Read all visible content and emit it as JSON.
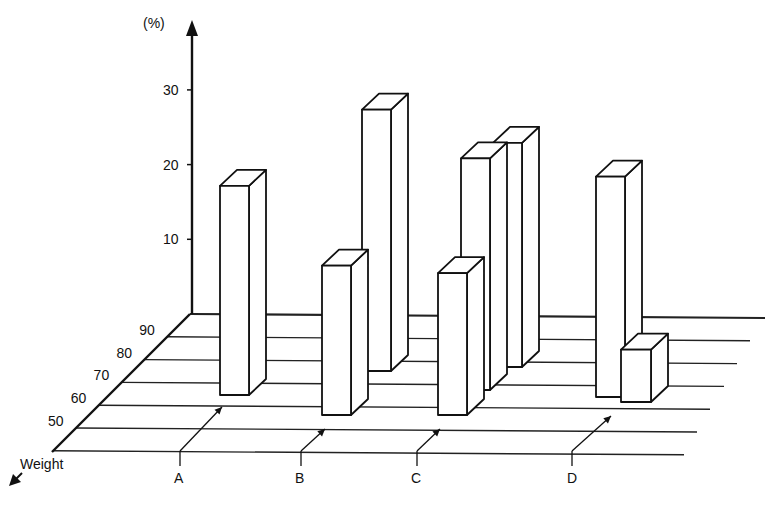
{
  "chart_data": {
    "type": "bar",
    "subtype": "3d-oblique-bar",
    "title": "",
    "ylabel": "(%)",
    "zlabel": "Weight",
    "yticks": [
      10,
      20,
      30
    ],
    "ylim": [
      0,
      35
    ],
    "weight_ticks": [
      50,
      60,
      70,
      80,
      90
    ],
    "groups": [
      "A",
      "B",
      "C",
      "D"
    ],
    "bars": [
      {
        "group": "A",
        "weight": 70,
        "value": 28
      },
      {
        "group": "B",
        "weight": 60,
        "value": 20
      },
      {
        "group": "B",
        "weight": 80,
        "value": 35
      },
      {
        "group": "C",
        "weight": 60,
        "value": 19
      },
      {
        "group": "C",
        "weight": 70,
        "value": 31
      },
      {
        "group": "C",
        "weight": 80,
        "value": 30
      },
      {
        "group": "D",
        "weight": 70,
        "value": 29.5
      },
      {
        "group": "D",
        "weight": 65,
        "value": 7
      }
    ],
    "grid": false,
    "legend": null
  },
  "labels": {
    "y_unit": "(%)",
    "weight": "Weight",
    "groupA": "A",
    "groupB": "B",
    "groupC": "C",
    "groupD": "D"
  },
  "colors": {
    "line": "#111111",
    "bar_fill": "#ffffff",
    "background": "#ffffff"
  }
}
